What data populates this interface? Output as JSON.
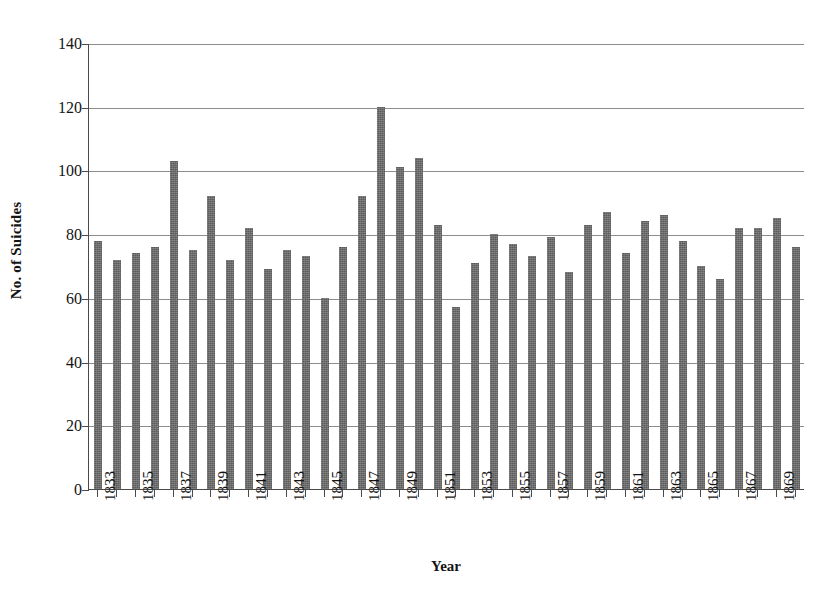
{
  "chart_data": {
    "type": "bar",
    "title": "",
    "xlabel": "Year",
    "ylabel": "No. of Suicides",
    "ylim": [
      0,
      140
    ],
    "ytick_values": [
      0,
      20,
      40,
      60,
      80,
      100,
      120,
      140
    ],
    "ytick_labels": [
      "0",
      "20",
      "40",
      "60",
      "80",
      "100",
      "120",
      "140"
    ],
    "grid": true,
    "legend": "none",
    "xtick_labels": [
      "1833",
      "1835",
      "1837",
      "1839",
      "1841",
      "1843",
      "1845",
      "1847",
      "1849",
      "1851",
      "1853",
      "1855",
      "1857",
      "1859",
      "1861",
      "1863",
      "1865",
      "1867",
      "1869"
    ],
    "xtick_label_interval": 2,
    "bar_color": "#5b5b5b",
    "categories": [
      "1833",
      "1834",
      "1835",
      "1836",
      "1837",
      "1838",
      "1839",
      "1840",
      "1841",
      "1842",
      "1843",
      "1844",
      "1845",
      "1846",
      "1847",
      "1848",
      "1849",
      "1850",
      "1851",
      "1852",
      "1853",
      "1854",
      "1855",
      "1856",
      "1857",
      "1858",
      "1859",
      "1860",
      "1861",
      "1862",
      "1863",
      "1864",
      "1865",
      "1866",
      "1867",
      "1868",
      "1869",
      "1870"
    ],
    "values": [
      78,
      72,
      74,
      76,
      103,
      75,
      92,
      72,
      82,
      69,
      75,
      73,
      60,
      76,
      92,
      120,
      101,
      104,
      83,
      57,
      71,
      80,
      77,
      73,
      79,
      68,
      83,
      87,
      74,
      84,
      86,
      78,
      70,
      66,
      82,
      82,
      85,
      76
    ]
  }
}
